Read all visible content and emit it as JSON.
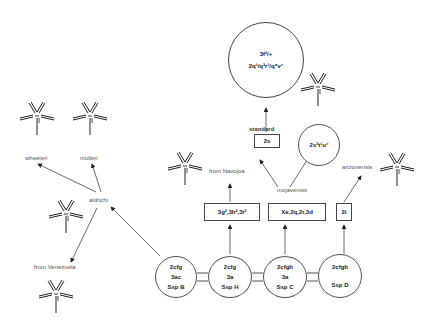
{
  "diagram": {
    "type": "phylogeny",
    "big_circle": {
      "line1": "3f²/+",
      "line2": "2q¹/q³r¹/q⁵v⁷"
    },
    "small_circle": {
      "text": "2s³t¹u⁷"
    },
    "standard_label": "standard",
    "boxes": [
      {
        "id": "box-2s",
        "text": "2s"
      },
      {
        "id": "box-navojoa",
        "text": "3g²,3h²,3i²"
      },
      {
        "id": "box-mojavensis",
        "text": "Xe,2q,2r,3d"
      },
      {
        "id": "box-arizonensis",
        "text": "2i"
      }
    ],
    "labels": {
      "wheeleri": "wheeleri",
      "mulleri": "mulleri",
      "aldrichi": "aldrichi",
      "from_venezuela": "from Venezuela",
      "from_navojoa": "from Navojoa",
      "mojavensis": "mojavensis",
      "arizonensis": "arizonensis"
    },
    "nodes": [
      {
        "lines": [
          "2cfg",
          "3ac",
          "Ssp B"
        ]
      },
      {
        "lines": [
          "2cfg",
          "3a",
          "Ssp H"
        ]
      },
      {
        "lines": [
          "2cfgh",
          "3a",
          "Ssp C"
        ]
      },
      {
        "lines": [
          "2cfgh",
          "Ssp D"
        ]
      }
    ]
  }
}
